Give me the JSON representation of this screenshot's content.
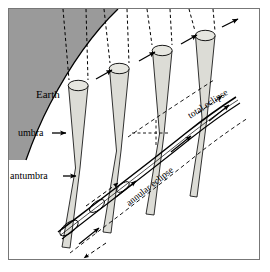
{
  "figure": {
    "background_color": "#ffffff",
    "frame_color": "#777777",
    "earth_fill": "#9a9a9a",
    "cone_fill": "#dcdcd6",
    "line_color": "#000000"
  },
  "labels": {
    "earth": "Earth",
    "umbra": "umbra",
    "antumbra": "antumbra",
    "total_eclipse": "total eclipse",
    "annular_eclipse": "annular eclipse"
  },
  "elements": {
    "earth_region": "earth-shaded-region",
    "earth_limb": "earth-limb-curve",
    "sun_rays": "dashed-sunlight-rays",
    "shadow_cones": "moon-shadow-cones",
    "moon_disks": "moon-disk-ellipses",
    "eclipse_track": "eclipse-path-track",
    "motion_arrows": "shadow-motion-arrows",
    "pointer_arrows": "label-pointer-arrows"
  },
  "counts": {
    "shadow_cones": 4,
    "sun_ray_pairs": 4
  }
}
